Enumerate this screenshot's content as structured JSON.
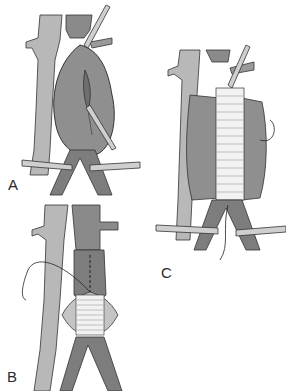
{
  "figure": {
    "panels": [
      {
        "id": "A",
        "label": "A",
        "description": "Aortic aneurysm exposed with clamps on proximal aorta and iliac arteries; longitudinal incision in aneurysm sac"
      },
      {
        "id": "B",
        "label": "B",
        "description": "Graft sewn to proximal aorta with running suture; distal anastomosis underway"
      },
      {
        "id": "C",
        "label": "C",
        "description": "Tube graft in place with aneurysm sac opened around it; suture ends visible"
      }
    ],
    "colors": {
      "vessel_light": "#b8b8b8",
      "vessel_mid": "#9a9a9a",
      "vessel_dark": "#7d7d7d",
      "aneurysm": "#8f8f8f",
      "graft": "#f2f2f2",
      "clamp": "#cfcfcf",
      "outline": "#333333"
    }
  }
}
